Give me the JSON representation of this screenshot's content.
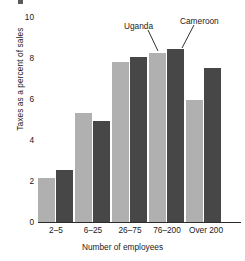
{
  "chart_data": {
    "type": "bar",
    "title": "",
    "subtitle": "",
    "xlabel": "Number of employees",
    "ylabel": "Taxes as a percent of sales",
    "categories": [
      "2–5",
      "6–25",
      "26–75",
      "76–200",
      "Over 200"
    ],
    "series": [
      {
        "name": "Uganda",
        "color": "#b0b0b0",
        "values": [
          2.15,
          5.3,
          7.8,
          8.25,
          5.95
        ]
      },
      {
        "name": "Cameroon",
        "color": "#474747",
        "values": [
          2.55,
          4.95,
          8.05,
          8.45,
          7.5
        ]
      }
    ],
    "ylim": [
      0,
      10
    ],
    "yticks": [
      0,
      2,
      4,
      6,
      8,
      10
    ],
    "ytick_labels": [
      "0",
      "2",
      "4",
      "6",
      "8",
      "10"
    ],
    "grid": false,
    "legend": "none",
    "annotations": [
      {
        "text": "Uganda",
        "points_to_series": "Uganda",
        "points_to_category": "76–200"
      },
      {
        "text": "Cameroon",
        "points_to_series": "Cameroon",
        "points_to_category": "76–200"
      }
    ]
  },
  "axes": {
    "y_title": "Taxes as a percent of sales",
    "x_title": "Number of employees",
    "y_labels": {
      "t10": "10",
      "t8": "8",
      "t6": "6",
      "t4": "4",
      "t2": "2",
      "t0": "0"
    },
    "x_labels": {
      "c0": "2–5",
      "c1": "6–25",
      "c2": "26–75",
      "c3": "76–200",
      "c4": "Over 200"
    }
  },
  "annotations": {
    "uganda": "Uganda",
    "cameroon": "Cameroon"
  },
  "colors": {
    "series_light": "#b0b0b0",
    "series_dark": "#474747",
    "axis": "#2b2b2b",
    "text": "#1a1a1a",
    "background": "#ffffff"
  }
}
